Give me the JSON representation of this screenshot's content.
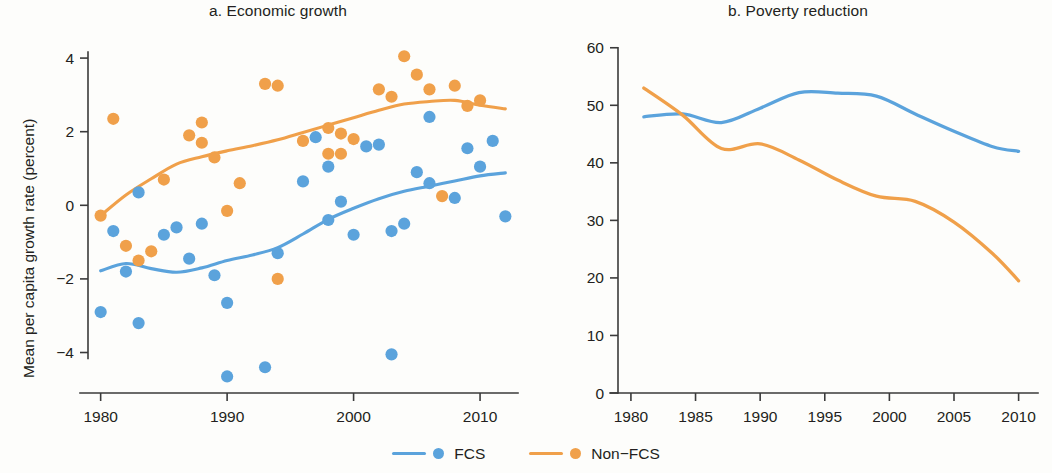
{
  "figure": {
    "background_color": "#fdfdfb",
    "text_color": "#231f20"
  },
  "legend": {
    "position": "bottom-center",
    "items": [
      {
        "label": "FCS",
        "color": "#5ba3dc",
        "marker": "line-and-dot"
      },
      {
        "label": "Non−FCS",
        "color": "#f0a04a",
        "marker": "line-and-dot"
      }
    ]
  },
  "panel_a": {
    "title": "a. Economic growth",
    "ylabel": "Mean per capita growth rate (percent)",
    "xlabel": "",
    "y_ticks": [
      "4",
      "2",
      "0",
      "−2",
      "−4"
    ],
    "x_ticks": [
      "1980",
      "1990",
      "2000",
      "2010"
    ]
  },
  "panel_b": {
    "title": "b. Poverty reduction",
    "ylabel": "Poverty headcount (percent)",
    "xlabel": "",
    "y_ticks": [
      "60",
      "50",
      "40",
      "30",
      "20",
      "10",
      "0"
    ],
    "x_ticks": [
      "1980",
      "1985",
      "1990",
      "1995",
      "2000",
      "2005",
      "2010"
    ]
  },
  "chart_data": [
    {
      "type": "scatter",
      "panel": "a",
      "title": "a. Economic growth",
      "xlabel": "",
      "ylabel": "Mean per capita growth rate (percent)",
      "xlim": [
        1979.0,
        2013.0
      ],
      "ylim": [
        -5.1,
        4.6
      ],
      "xticks": [
        1980,
        1990,
        2000,
        2010
      ],
      "yticks": [
        -4,
        -2,
        0,
        2,
        4
      ],
      "grid": false,
      "series": [
        {
          "name": "FCS",
          "color": "#5ba3dc",
          "marker": "circle",
          "points": [
            [
              1980,
              -2.9
            ],
            [
              1981,
              -0.7
            ],
            [
              1982,
              -1.8
            ],
            [
              1983,
              -3.2
            ],
            [
              1983,
              0.35
            ],
            [
              1985,
              -0.8
            ],
            [
              1986,
              -0.6
            ],
            [
              1987,
              -1.45
            ],
            [
              1988,
              -0.5
            ],
            [
              1989,
              -1.9
            ],
            [
              1990,
              -4.65
            ],
            [
              1990,
              -2.65
            ],
            [
              1993,
              -4.4
            ],
            [
              1994,
              -1.3
            ],
            [
              1996,
              0.65
            ],
            [
              1997,
              1.85
            ],
            [
              1998,
              -0.4
            ],
            [
              1998,
              1.05
            ],
            [
              1999,
              0.1
            ],
            [
              2000,
              -0.8
            ],
            [
              2001,
              1.6
            ],
            [
              2002,
              1.65
            ],
            [
              2003,
              -4.05
            ],
            [
              2003,
              -0.7
            ],
            [
              2004,
              -0.5
            ],
            [
              2005,
              0.9
            ],
            [
              2006,
              0.6
            ],
            [
              2006,
              2.4
            ],
            [
              2008,
              0.2
            ],
            [
              2009,
              1.55
            ],
            [
              2010,
              1.05
            ],
            [
              2011,
              1.75
            ],
            [
              2012,
              -0.3
            ]
          ],
          "trend_line": [
            [
              1980,
              -1.78
            ],
            [
              1982,
              -1.58
            ],
            [
              1984,
              -1.72
            ],
            [
              1986,
              -1.82
            ],
            [
              1988,
              -1.7
            ],
            [
              1990,
              -1.5
            ],
            [
              1992,
              -1.35
            ],
            [
              1994,
              -1.15
            ],
            [
              1996,
              -0.78
            ],
            [
              1998,
              -0.38
            ],
            [
              2000,
              -0.08
            ],
            [
              2002,
              0.18
            ],
            [
              2004,
              0.38
            ],
            [
              2006,
              0.52
            ],
            [
              2008,
              0.66
            ],
            [
              2010,
              0.8
            ],
            [
              2012,
              0.88
            ]
          ]
        },
        {
          "name": "Non−FCS",
          "color": "#f0a04a",
          "marker": "circle",
          "points": [
            [
              1980,
              -0.28
            ],
            [
              1981,
              2.35
            ],
            [
              1982,
              -1.1
            ],
            [
              1983,
              -1.5
            ],
            [
              1984,
              -1.25
            ],
            [
              1985,
              0.7
            ],
            [
              1987,
              1.9
            ],
            [
              1988,
              1.7
            ],
            [
              1988,
              2.25
            ],
            [
              1989,
              1.3
            ],
            [
              1990,
              -0.15
            ],
            [
              1991,
              0.6
            ],
            [
              1993,
              3.3
            ],
            [
              1994,
              -2.0
            ],
            [
              1994,
              3.25
            ],
            [
              1996,
              1.75
            ],
            [
              1998,
              2.1
            ],
            [
              1998,
              1.4
            ],
            [
              1999,
              1.95
            ],
            [
              1999,
              1.4
            ],
            [
              2000,
              1.8
            ],
            [
              2002,
              3.15
            ],
            [
              2003,
              2.95
            ],
            [
              2004,
              4.05
            ],
            [
              2005,
              3.55
            ],
            [
              2006,
              3.15
            ],
            [
              2007,
              0.25
            ],
            [
              2008,
              3.25
            ],
            [
              2009,
              2.7
            ],
            [
              2010,
              2.85
            ]
          ],
          "trend_line": [
            [
              1980,
              -0.28
            ],
            [
              1982,
              0.28
            ],
            [
              1984,
              0.72
            ],
            [
              1986,
              1.12
            ],
            [
              1988,
              1.32
            ],
            [
              1990,
              1.48
            ],
            [
              1992,
              1.62
            ],
            [
              1994,
              1.78
            ],
            [
              1996,
              1.98
            ],
            [
              1998,
              2.18
            ],
            [
              2000,
              2.38
            ],
            [
              2002,
              2.58
            ],
            [
              2004,
              2.75
            ],
            [
              2006,
              2.82
            ],
            [
              2008,
              2.85
            ],
            [
              2010,
              2.72
            ],
            [
              2012,
              2.62
            ]
          ]
        }
      ]
    },
    {
      "type": "line",
      "panel": "b",
      "title": "b. Poverty reduction",
      "xlabel": "",
      "ylabel": "Poverty headcount (percent)",
      "xlim": [
        1979.0,
        2011.5
      ],
      "ylim": [
        0,
        61
      ],
      "xticks": [
        1980,
        1985,
        1990,
        1995,
        2000,
        2005,
        2010
      ],
      "yticks": [
        0,
        10,
        20,
        30,
        40,
        50,
        60
      ],
      "grid": false,
      "series": [
        {
          "name": "FCS",
          "color": "#5ba3dc",
          "x": [
            1981,
            1984,
            1987,
            1990,
            1993,
            1996,
            1999,
            2002,
            2005,
            2008,
            2010
          ],
          "values": [
            48.0,
            48.5,
            47.0,
            49.5,
            52.2,
            52.1,
            51.6,
            48.5,
            45.5,
            42.8,
            42.0
          ]
        },
        {
          "name": "Non−FCS",
          "color": "#f0a04a",
          "x": [
            1981,
            1984,
            1987,
            1990,
            1993,
            1996,
            1999,
            2002,
            2005,
            2008,
            2010
          ],
          "values": [
            53.0,
            48.3,
            42.5,
            43.3,
            40.5,
            37.0,
            34.2,
            33.3,
            29.7,
            24.2,
            19.5
          ]
        }
      ]
    }
  ]
}
